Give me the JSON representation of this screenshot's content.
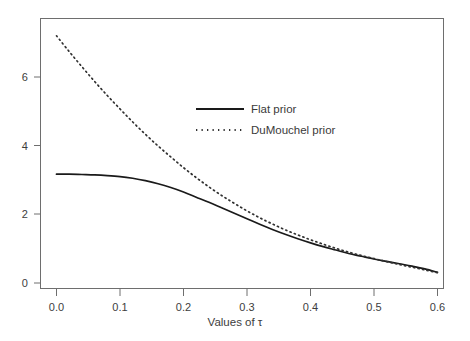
{
  "chart_data": {
    "type": "line",
    "title": "",
    "xlabel": "Values of τ",
    "ylabel": "",
    "xlim": [
      0.0,
      0.6
    ],
    "ylim": [
      0.0,
      7.6
    ],
    "grid": false,
    "legend_position": "upper-center-right",
    "xticks": [
      "0.0",
      "0.1",
      "0.2",
      "0.3",
      "0.4",
      "0.5",
      "0.6"
    ],
    "xtick_values": [
      0.0,
      0.1,
      0.2,
      0.3,
      0.4,
      0.5,
      0.6
    ],
    "yticks": [
      "0",
      "2",
      "4",
      "6"
    ],
    "ytick_values": [
      0,
      2,
      4,
      6
    ],
    "x": [
      0.0,
      0.02,
      0.04,
      0.06,
      0.08,
      0.1,
      0.12,
      0.14,
      0.16,
      0.18,
      0.2,
      0.22,
      0.24,
      0.26,
      0.28,
      0.3,
      0.32,
      0.34,
      0.36,
      0.38,
      0.4,
      0.42,
      0.44,
      0.46,
      0.48,
      0.5,
      0.52,
      0.54,
      0.56,
      0.58,
      0.6
    ],
    "series": [
      {
        "name": "Flat prior",
        "style": "solid",
        "color": "#1a1a1a",
        "values": [
          3.17,
          3.17,
          3.16,
          3.15,
          3.13,
          3.1,
          3.05,
          2.98,
          2.89,
          2.78,
          2.65,
          2.5,
          2.35,
          2.19,
          2.03,
          1.87,
          1.71,
          1.56,
          1.42,
          1.29,
          1.17,
          1.06,
          0.96,
          0.86,
          0.78,
          0.7,
          0.63,
          0.56,
          0.49,
          0.41,
          0.31
        ]
      },
      {
        "name": "DuMouchel prior",
        "style": "dotted",
        "color": "#303030",
        "values": [
          7.2,
          6.74,
          6.3,
          5.87,
          5.46,
          5.07,
          4.69,
          4.33,
          3.99,
          3.67,
          3.36,
          3.07,
          2.8,
          2.55,
          2.32,
          2.1,
          1.9,
          1.72,
          1.55,
          1.4,
          1.26,
          1.13,
          1.01,
          0.9,
          0.8,
          0.71,
          0.62,
          0.54,
          0.46,
          0.38,
          0.3
        ]
      }
    ],
    "annotations": [
      {
        "text": "curves cross near τ = 0.145"
      }
    ]
  },
  "legend": {
    "items": [
      {
        "label": "Flat prior",
        "style": "solid"
      },
      {
        "label": "DuMouchel prior",
        "style": "dotted"
      }
    ]
  },
  "axes": {
    "x_title": "Values of τ",
    "frame_color": "#6e6e6e"
  }
}
